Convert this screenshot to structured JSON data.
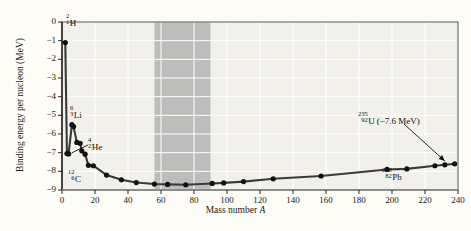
{
  "chart_data": {
    "type": "line",
    "title": "",
    "xlabel": "Mass number A",
    "ylabel": "Binding energy per nucleon (MeV)",
    "xlim": [
      0,
      240
    ],
    "ylim": [
      -9,
      0
    ],
    "xticks": [
      0,
      20,
      40,
      60,
      80,
      100,
      120,
      140,
      160,
      180,
      200,
      220,
      240
    ],
    "yticks": [
      0,
      -1,
      -2,
      -3,
      -4,
      -5,
      -6,
      -7,
      -8,
      -9
    ],
    "grid": true,
    "grid_color": "#ffffff",
    "legend": "none",
    "line_color": "#3a3a3a",
    "marker_color": "#111111",
    "shaded_band": {
      "label": "region of most stable nuclei",
      "x_start": 56,
      "x_end": 90,
      "color": "#b9b9b9"
    },
    "x": [
      2,
      3,
      4,
      6,
      7,
      9,
      11,
      12,
      14,
      16,
      19,
      27,
      36,
      45,
      56,
      64,
      75,
      91,
      98,
      110,
      128,
      157,
      197,
      209,
      226,
      232,
      238
    ],
    "y": [
      -1.1,
      -7.05,
      -7.07,
      -5.5,
      -5.6,
      -6.45,
      -6.5,
      -6.9,
      -7.08,
      -7.68,
      -7.7,
      -8.2,
      -8.45,
      -8.6,
      -8.68,
      -8.7,
      -8.72,
      -8.65,
      -8.62,
      -8.55,
      -8.4,
      -8.25,
      -7.9,
      -7.87,
      -7.7,
      -7.65,
      -7.6
    ],
    "annotations": [
      {
        "id": "h2",
        "element_label": "H",
        "mass_number": "2",
        "atomic_number": "1",
        "x": 2,
        "y": -1.1
      },
      {
        "id": "li6",
        "element_label": "Li",
        "mass_number": "6",
        "atomic_number": "3",
        "x": 6,
        "y": -5.5
      },
      {
        "id": "he4",
        "element_label": "He",
        "mass_number": "4",
        "atomic_number": "2",
        "x": 4,
        "y": -7.07
      },
      {
        "id": "c12",
        "element_label": "C",
        "mass_number": "12",
        "atomic_number": "6",
        "x": 12,
        "y": -7.68
      },
      {
        "id": "pb208",
        "element_label": "Pb",
        "mass_number": "208",
        "atomic_number": "82",
        "x": 209,
        "y": -7.87
      },
      {
        "id": "u235",
        "element_label": "U",
        "mass_number": "235",
        "atomic_number": "92",
        "value_text": "(−7.6 MeV)",
        "x": 235,
        "y": -7.62
      }
    ]
  },
  "axis": {
    "y_tick_labels": [
      "0",
      "−1",
      "−2",
      "−3",
      "−4",
      "−5",
      "−6",
      "−7",
      "−8",
      "−9"
    ],
    "x_tick_labels": [
      "0",
      "20",
      "40",
      "60",
      "80",
      "100",
      "120",
      "140",
      "160",
      "180",
      "200",
      "220",
      "240"
    ],
    "y_title": "Binding energy per nucleon (MeV)",
    "x_title_prefix": "Mass number ",
    "x_title_italic": "A"
  }
}
